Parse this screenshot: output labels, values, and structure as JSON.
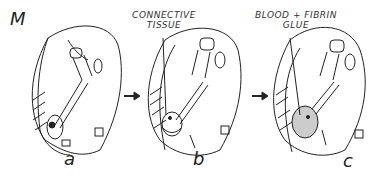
{
  "figure": {
    "label": "M",
    "panels": [
      {
        "id": "a",
        "label": "a"
      },
      {
        "id": "b",
        "label": "b",
        "annotation_line1": "CONNECTIVE",
        "annotation_line2": "TISSUE"
      },
      {
        "id": "c",
        "label": "c",
        "annotation_line1": "BLOOD + FIBRIN",
        "annotation_line2": "GLUE"
      }
    ]
  }
}
